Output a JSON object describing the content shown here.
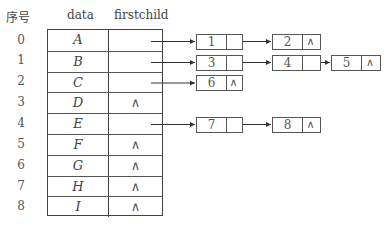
{
  "headers": {
    "index": "序号",
    "data": "data",
    "firstchild": "firstchild"
  },
  "rows": [
    {
      "index": "0",
      "data": "A",
      "firstchild": ""
    },
    {
      "index": "1",
      "data": "B",
      "firstchild": ""
    },
    {
      "index": "2",
      "data": "C",
      "firstchild": ""
    },
    {
      "index": "3",
      "data": "D",
      "firstchild": "∧"
    },
    {
      "index": "4",
      "data": "E",
      "firstchild": ""
    },
    {
      "index": "5",
      "data": "F",
      "firstchild": "∧"
    },
    {
      "index": "6",
      "data": "G",
      "firstchild": "∧"
    },
    {
      "index": "7",
      "data": "H",
      "firstchild": "∧"
    },
    {
      "index": "8",
      "data": "I",
      "firstchild": "∧"
    }
  ],
  "child_lists": [
    {
      "parent_row": 0,
      "nodes": [
        {
          "child": "1",
          "next": ""
        },
        {
          "child": "2",
          "next": "∧"
        }
      ]
    },
    {
      "parent_row": 1,
      "nodes": [
        {
          "child": "3",
          "next": ""
        },
        {
          "child": "4",
          "next": ""
        },
        {
          "child": "5",
          "next": "∧"
        }
      ]
    },
    {
      "parent_row": 2,
      "nodes": [
        {
          "child": "6",
          "next": "∧"
        }
      ]
    },
    {
      "parent_row": 4,
      "nodes": [
        {
          "child": "7",
          "next": ""
        },
        {
          "child": "8",
          "next": "∧"
        }
      ]
    }
  ],
  "null_symbol": "∧"
}
